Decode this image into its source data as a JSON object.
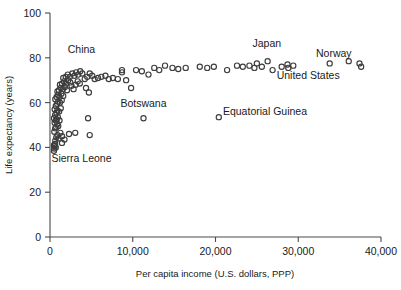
{
  "chart_data": {
    "type": "scatter",
    "title": "",
    "xlabel": "Per capita income (U.S. dollars, PPP)",
    "ylabel": "Life expectancy (years)",
    "xlim": [
      0,
      40000
    ],
    "ylim": [
      0,
      100
    ],
    "grid": false,
    "legend": "none",
    "xticks": [
      0,
      10000,
      20000,
      30000,
      40000
    ],
    "xtick_labels": [
      "0",
      "10,000",
      "20,000",
      "30,000",
      "40,000"
    ],
    "yticks": [
      0,
      20,
      40,
      60,
      80,
      100
    ],
    "ytick_labels": [
      "0",
      "20",
      "40",
      "60",
      "80",
      "100"
    ],
    "marker": "open-circle",
    "marker_color": "#3d3d3d",
    "annotations": [
      {
        "label": "China",
        "x": 3800,
        "y": 82,
        "anchor": "middle"
      },
      {
        "label": "Botswana",
        "x": 11300,
        "y": 58,
        "anchor": "middle"
      },
      {
        "label": "Equatorial Guinea",
        "x": 20900,
        "y": 54.5,
        "anchor": "start"
      },
      {
        "label": "Sierra Leone",
        "x": 3800,
        "y": 33.5,
        "anchor": "middle"
      },
      {
        "label": "Japan",
        "x": 26200,
        "y": 85,
        "anchor": "middle"
      },
      {
        "label": "Norway",
        "x": 34300,
        "y": 80.5,
        "anchor": "middle"
      },
      {
        "label": "United States",
        "x": 31200,
        "y": 70.5,
        "anchor": "middle"
      }
    ],
    "points": [
      {
        "x": 480,
        "y": 38.5
      },
      {
        "x": 520,
        "y": 39.5
      },
      {
        "x": 560,
        "y": 40.5
      },
      {
        "x": 610,
        "y": 41.5
      },
      {
        "x": 480,
        "y": 41.0
      },
      {
        "x": 700,
        "y": 40.0
      },
      {
        "x": 640,
        "y": 43.0
      },
      {
        "x": 760,
        "y": 44.5
      },
      {
        "x": 900,
        "y": 45.5
      },
      {
        "x": 1050,
        "y": 44.0
      },
      {
        "x": 1250,
        "y": 46.5
      },
      {
        "x": 1450,
        "y": 45.0
      },
      {
        "x": 520,
        "y": 47.0
      },
      {
        "x": 620,
        "y": 48.5
      },
      {
        "x": 760,
        "y": 49.0
      },
      {
        "x": 880,
        "y": 50.5
      },
      {
        "x": 1000,
        "y": 49.5
      },
      {
        "x": 560,
        "y": 51.0
      },
      {
        "x": 700,
        "y": 52.0
      },
      {
        "x": 820,
        "y": 52.5
      },
      {
        "x": 950,
        "y": 53.5
      },
      {
        "x": 1150,
        "y": 52.0
      },
      {
        "x": 480,
        "y": 53.0
      },
      {
        "x": 620,
        "y": 54.5
      },
      {
        "x": 780,
        "y": 55.5
      },
      {
        "x": 900,
        "y": 56.5
      },
      {
        "x": 1100,
        "y": 56.0
      },
      {
        "x": 1300,
        "y": 57.5
      },
      {
        "x": 560,
        "y": 57.0
      },
      {
        "x": 700,
        "y": 58.5
      },
      {
        "x": 860,
        "y": 59.5
      },
      {
        "x": 1000,
        "y": 60.5
      },
      {
        "x": 1200,
        "y": 60.0
      },
      {
        "x": 1420,
        "y": 61.0
      },
      {
        "x": 640,
        "y": 61.5
      },
      {
        "x": 800,
        "y": 62.5
      },
      {
        "x": 980,
        "y": 63.5
      },
      {
        "x": 1150,
        "y": 62.5
      },
      {
        "x": 1380,
        "y": 64.0
      },
      {
        "x": 1600,
        "y": 63.0
      },
      {
        "x": 900,
        "y": 65.0
      },
      {
        "x": 1080,
        "y": 65.5
      },
      {
        "x": 1300,
        "y": 66.5
      },
      {
        "x": 1550,
        "y": 66.0
      },
      {
        "x": 1800,
        "y": 67.0
      },
      {
        "x": 2050,
        "y": 65.5
      },
      {
        "x": 1200,
        "y": 68.0
      },
      {
        "x": 1450,
        "y": 68.5
      },
      {
        "x": 1700,
        "y": 69.5
      },
      {
        "x": 1950,
        "y": 68.5
      },
      {
        "x": 2200,
        "y": 70.0
      },
      {
        "x": 2450,
        "y": 69.0
      },
      {
        "x": 1600,
        "y": 71.0
      },
      {
        "x": 1900,
        "y": 71.5
      },
      {
        "x": 2150,
        "y": 72.5
      },
      {
        "x": 2400,
        "y": 71.5
      },
      {
        "x": 2700,
        "y": 73.0
      },
      {
        "x": 2950,
        "y": 72.0
      },
      {
        "x": 3150,
        "y": 73.5
      },
      {
        "x": 3400,
        "y": 72.5
      },
      {
        "x": 3650,
        "y": 74.0
      },
      {
        "x": 3900,
        "y": 73.0
      },
      {
        "x": 2600,
        "y": 67.5
      },
      {
        "x": 2850,
        "y": 66.0
      },
      {
        "x": 3100,
        "y": 68.0
      },
      {
        "x": 3350,
        "y": 69.5
      },
      {
        "x": 3600,
        "y": 68.5
      },
      {
        "x": 4200,
        "y": 70.5
      },
      {
        "x": 4500,
        "y": 71.5
      },
      {
        "x": 4800,
        "y": 73.0
      },
      {
        "x": 5100,
        "y": 72.0
      },
      {
        "x": 4350,
        "y": 66.5
      },
      {
        "x": 4700,
        "y": 64.5
      },
      {
        "x": 5400,
        "y": 70.5
      },
      {
        "x": 5800,
        "y": 71.0
      },
      {
        "x": 6200,
        "y": 71.5
      },
      {
        "x": 6700,
        "y": 72.0
      },
      {
        "x": 7100,
        "y": 70.5
      },
      {
        "x": 7600,
        "y": 71.0
      },
      {
        "x": 8200,
        "y": 70.5
      },
      {
        "x": 8700,
        "y": 73.5
      },
      {
        "x": 8700,
        "y": 74.5
      },
      {
        "x": 9200,
        "y": 70.0
      },
      {
        "x": 9800,
        "y": 66.5
      },
      {
        "x": 10400,
        "y": 74.5
      },
      {
        "x": 11100,
        "y": 74.0
      },
      {
        "x": 11900,
        "y": 72.5
      },
      {
        "x": 12600,
        "y": 75.5
      },
      {
        "x": 13200,
        "y": 74.5
      },
      {
        "x": 13900,
        "y": 76.5
      },
      {
        "x": 14800,
        "y": 75.5
      },
      {
        "x": 15500,
        "y": 75.0
      },
      {
        "x": 16400,
        "y": 75.5
      },
      {
        "x": 18100,
        "y": 76.0
      },
      {
        "x": 19000,
        "y": 75.5
      },
      {
        "x": 19800,
        "y": 76.0
      },
      {
        "x": 21400,
        "y": 74.5
      },
      {
        "x": 22600,
        "y": 76.5
      },
      {
        "x": 23300,
        "y": 76.0
      },
      {
        "x": 24100,
        "y": 76.5
      },
      {
        "x": 24700,
        "y": 75.5
      },
      {
        "x": 25000,
        "y": 77.5
      },
      {
        "x": 25600,
        "y": 76.0
      },
      {
        "x": 26300,
        "y": 78.5
      },
      {
        "x": 26900,
        "y": 74.5
      },
      {
        "x": 28000,
        "y": 76.0
      },
      {
        "x": 28700,
        "y": 77.0
      },
      {
        "x": 28800,
        "y": 75.5
      },
      {
        "x": 29400,
        "y": 76.5
      },
      {
        "x": 33800,
        "y": 77.5
      },
      {
        "x": 36100,
        "y": 78.5
      },
      {
        "x": 37400,
        "y": 77.5
      },
      {
        "x": 37600,
        "y": 76.0
      },
      {
        "x": 4600,
        "y": 53.0
      },
      {
        "x": 4800,
        "y": 45.5
      },
      {
        "x": 11300,
        "y": 53.0
      },
      {
        "x": 20400,
        "y": 53.5
      },
      {
        "x": 3050,
        "y": 46.5
      },
      {
        "x": 2300,
        "y": 46.0
      },
      {
        "x": 1750,
        "y": 43.5
      },
      {
        "x": 1450,
        "y": 42.0
      }
    ]
  }
}
